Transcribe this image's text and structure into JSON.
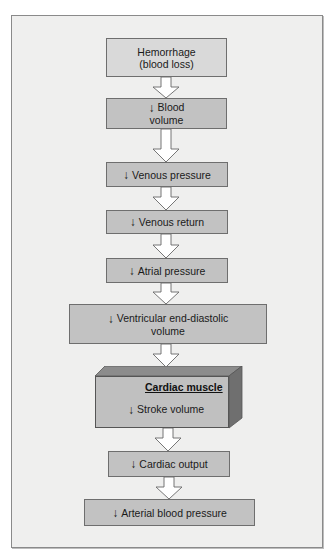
{
  "diagram": {
    "type": "flowchart",
    "direction": "top-to-bottom",
    "decrease_symbol": "↓",
    "colors": {
      "frame_background": "#efefee",
      "box_fill": "#c2c2c2",
      "first_box_fill": "#d9d9d9",
      "arrow_fill": "#ffffff",
      "border": "#6e6e6e"
    },
    "steps": [
      {
        "line1": "Hemorrhage",
        "line2": "(blood loss)",
        "decrease": false
      },
      {
        "line1": "Blood",
        "line2": "volume",
        "decrease": true
      },
      {
        "label": "Venous pressure",
        "decrease": true
      },
      {
        "label": "Venous return",
        "decrease": true
      },
      {
        "label": "Atrial pressure",
        "decrease": true
      },
      {
        "line1": "Ventricular end-diastolic",
        "line2": "volume",
        "decrease": true
      },
      {
        "group_title": "Cardiac muscle",
        "label": "Stroke volume",
        "decrease": true
      },
      {
        "label": "Cardiac output",
        "decrease": true
      },
      {
        "label": "Arterial blood pressure",
        "decrease": true
      }
    ]
  }
}
